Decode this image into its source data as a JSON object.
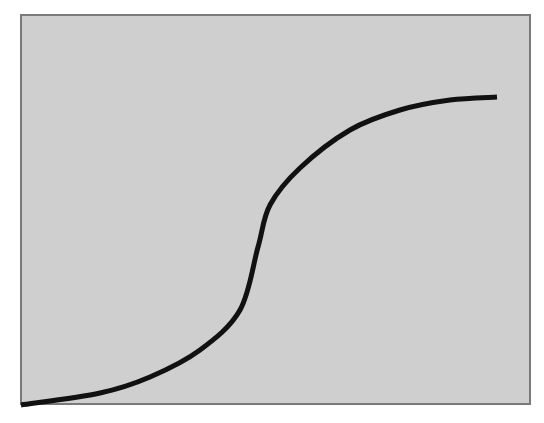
{
  "figure": {
    "background_color": "#cfcfcf",
    "border_color": "#7a7a7a",
    "line_color": "#111111"
  },
  "chart_data": {
    "type": "line",
    "title": "",
    "xlabel": "",
    "ylabel": "",
    "grid": false,
    "legend": null,
    "series": [
      {
        "name": "curve",
        "pixel_points": [
          [
            21,
            405
          ],
          [
            100,
            393
          ],
          [
            150,
            377
          ],
          [
            200,
            350
          ],
          [
            240,
            310
          ],
          [
            258,
            247
          ],
          [
            270,
            205
          ],
          [
            300,
            168
          ],
          [
            350,
            130
          ],
          [
            400,
            110
          ],
          [
            450,
            100
          ],
          [
            497,
            97
          ]
        ]
      }
    ]
  }
}
